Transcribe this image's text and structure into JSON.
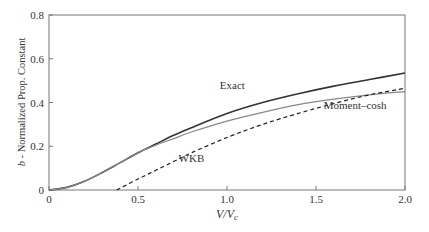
{
  "chart_data": {
    "type": "line",
    "title": "",
    "xlabel": "V/V_c",
    "ylabel": "b - Normalized Prop. Constant",
    "xlim": [
      0,
      2.0
    ],
    "ylim": [
      0,
      0.8
    ],
    "xticks": [
      "0",
      "0.5",
      "1.0",
      "1.5",
      "2.0"
    ],
    "yticks": [
      "0",
      "0.2",
      "0.4",
      "0.6",
      "0.8"
    ],
    "grid": false,
    "legend": "inline labels",
    "series": [
      {
        "name": "Exact",
        "style": "solid dark",
        "x": [
          0,
          0.1,
          0.2,
          0.3,
          0.4,
          0.5,
          0.6,
          0.7,
          0.8,
          1.0,
          1.2,
          1.4,
          1.6,
          1.8,
          2.0
        ],
        "values": [
          0,
          0.012,
          0.04,
          0.08,
          0.125,
          0.17,
          0.21,
          0.25,
          0.285,
          0.35,
          0.4,
          0.44,
          0.475,
          0.505,
          0.535
        ]
      },
      {
        "name": "Moment–cosh",
        "style": "solid gray",
        "x": [
          0,
          0.1,
          0.2,
          0.3,
          0.4,
          0.5,
          0.6,
          0.7,
          0.8,
          1.0,
          1.2,
          1.4,
          1.6,
          1.8,
          2.0
        ],
        "values": [
          0,
          0.012,
          0.04,
          0.08,
          0.125,
          0.17,
          0.205,
          0.235,
          0.265,
          0.315,
          0.355,
          0.39,
          0.415,
          0.435,
          0.45
        ]
      },
      {
        "name": "WKB",
        "style": "dashed",
        "x": [
          0.38,
          0.5,
          0.6,
          0.7,
          0.8,
          1.0,
          1.2,
          1.4,
          1.6,
          1.8,
          2.0
        ],
        "values": [
          0,
          0.05,
          0.09,
          0.13,
          0.17,
          0.24,
          0.3,
          0.35,
          0.395,
          0.435,
          0.465
        ]
      }
    ],
    "annotations": [
      {
        "text": "Exact",
        "x": 1.03,
        "y": 0.46
      },
      {
        "text": "Moment–cosh",
        "x": 1.72,
        "y": 0.37
      },
      {
        "text": "WKB",
        "x": 0.8,
        "y": 0.13
      }
    ]
  }
}
